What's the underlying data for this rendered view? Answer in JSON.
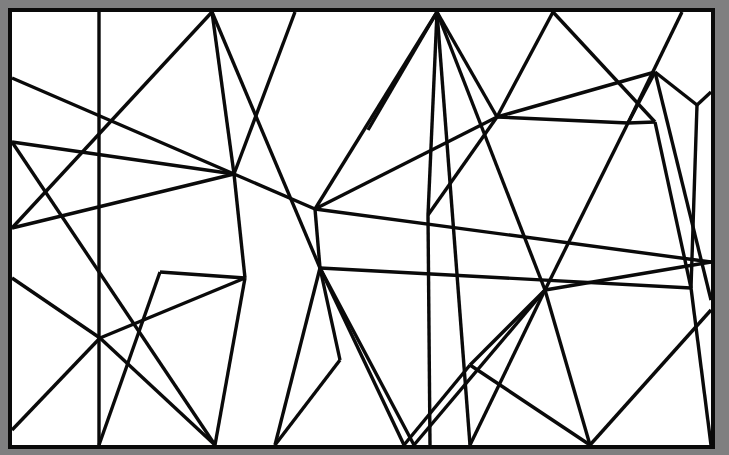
{
  "artwork": {
    "title": "Abstract Geometric Line Composition",
    "description": "Black straight-line segments forming irregular polygons inside a rectangular black frame on white ground, surrounded by a gray border.",
    "canvas": {
      "width": 729,
      "height": 455,
      "background_color": "#7f7f80",
      "paper_color": "#ffffff",
      "ink_color": "#0a0a0a",
      "frame_stroke_width": 4,
      "segment_stroke_width": 3.4
    },
    "frame": {
      "x": 10,
      "y": 10,
      "width": 703,
      "height": 437,
      "label": "outer-black-rectangle"
    },
    "segments": [
      {
        "id": "s01",
        "x1": 99,
        "y1": 12,
        "x2": 99,
        "y2": 445,
        "note": "long vertical near left"
      },
      {
        "id": "s02",
        "x1": 212,
        "y1": 12,
        "x2": 12,
        "y2": 228,
        "note": "top fan to left edge"
      },
      {
        "id": "s03",
        "x1": 212,
        "y1": 12,
        "x2": 234,
        "y2": 174,
        "note": "top fan to center hub"
      },
      {
        "id": "s04",
        "x1": 212,
        "y1": 12,
        "x2": 320,
        "y2": 268,
        "note": "top fan long diagonal"
      },
      {
        "id": "s05",
        "x1": 12,
        "y1": 78,
        "x2": 234,
        "y2": 174,
        "note": "left edge to center hub"
      },
      {
        "id": "s06",
        "x1": 234,
        "y1": 174,
        "x2": 12,
        "y2": 142,
        "note": "center hub to left V"
      },
      {
        "id": "s07",
        "x1": 12,
        "y1": 142,
        "x2": 215,
        "y2": 445,
        "note": "left V down to bottom"
      },
      {
        "id": "s08",
        "x1": 295,
        "y1": 12,
        "x2": 295,
        "y2": 12,
        "note": "top vertical start"
      },
      {
        "id": "s09",
        "x1": 295,
        "y1": 12,
        "x2": 234,
        "y2": 174,
        "note": "top vertical toward hub"
      },
      {
        "id": "s10",
        "x1": 234,
        "y1": 174,
        "x2": 245,
        "y2": 278,
        "note": "hub down segment"
      },
      {
        "id": "s11",
        "x1": 245,
        "y1": 278,
        "x2": 215,
        "y2": 445,
        "note": "down to bottom edge"
      },
      {
        "id": "s12",
        "x1": 437,
        "y1": 12,
        "x2": 368,
        "y2": 130,
        "note": "big fan leftmost"
      },
      {
        "id": "s13",
        "x1": 437,
        "y1": 12,
        "x2": 428,
        "y2": 215,
        "note": "big fan near vertical"
      },
      {
        "id": "s14",
        "x1": 437,
        "y1": 12,
        "x2": 315,
        "y2": 209,
        "note": "big fan to mid hub"
      },
      {
        "id": "s15",
        "x1": 437,
        "y1": 12,
        "x2": 470,
        "y2": 445,
        "note": "big fan long down"
      },
      {
        "id": "s16",
        "x1": 437,
        "y1": 12,
        "x2": 545,
        "y2": 290,
        "note": "big fan to right hub"
      },
      {
        "id": "s17",
        "x1": 437,
        "y1": 12,
        "x2": 497,
        "y2": 117,
        "note": "big fan short right"
      },
      {
        "id": "s18",
        "x1": 553,
        "y1": 12,
        "x2": 497,
        "y2": 117,
        "note": "top to junction"
      },
      {
        "id": "s19",
        "x1": 553,
        "y1": 12,
        "x2": 655,
        "y2": 122,
        "note": "top to right knot"
      },
      {
        "id": "s20",
        "x1": 682,
        "y1": 12,
        "x2": 628,
        "y2": 123,
        "note": "top right short"
      },
      {
        "id": "s21",
        "x1": 12,
        "y1": 228,
        "x2": 234,
        "y2": 174,
        "note": "left edge long to hub"
      },
      {
        "id": "s22",
        "x1": 234,
        "y1": 174,
        "x2": 315,
        "y2": 209,
        "note": "hub to mid hub"
      },
      {
        "id": "s23",
        "x1": 315,
        "y1": 209,
        "x2": 497,
        "y2": 117,
        "note": "mid hub to junction"
      },
      {
        "id": "s24",
        "x1": 497,
        "y1": 117,
        "x2": 655,
        "y2": 72,
        "note": "junction to upper right"
      },
      {
        "id": "s25",
        "x1": 655,
        "y1": 72,
        "x2": 697,
        "y2": 105,
        "note": "upper right to knot"
      },
      {
        "id": "s26",
        "x1": 697,
        "y1": 105,
        "x2": 711,
        "y2": 92,
        "note": "knot to right edge"
      },
      {
        "id": "s27",
        "x1": 697,
        "y1": 105,
        "x2": 691,
        "y2": 288,
        "note": "right long vertical"
      },
      {
        "id": "s28",
        "x1": 655,
        "y1": 72,
        "x2": 711,
        "y2": 300,
        "note": "upper right long down"
      },
      {
        "id": "s29",
        "x1": 315,
        "y1": 209,
        "x2": 711,
        "y2": 262,
        "note": "long near-horizontal right"
      },
      {
        "id": "s30",
        "x1": 315,
        "y1": 209,
        "x2": 320,
        "y2": 268,
        "note": "short link between hubs"
      },
      {
        "id": "s31",
        "x1": 320,
        "y1": 268,
        "x2": 691,
        "y2": 288,
        "note": "long horizontal spanning"
      },
      {
        "id": "s32",
        "x1": 320,
        "y1": 268,
        "x2": 275,
        "y2": 445,
        "note": "hub down to bottom"
      },
      {
        "id": "s33",
        "x1": 320,
        "y1": 268,
        "x2": 404,
        "y2": 445,
        "note": "hub down right to bottom"
      },
      {
        "id": "s34",
        "x1": 320,
        "y1": 268,
        "x2": 414,
        "y2": 445,
        "note": "hub down to bottom 2"
      },
      {
        "id": "s35",
        "x1": 245,
        "y1": 278,
        "x2": 100,
        "y2": 338,
        "note": "to left X crossing"
      },
      {
        "id": "s36",
        "x1": 100,
        "y1": 338,
        "x2": 12,
        "y2": 430,
        "note": "X to lower left corner"
      },
      {
        "id": "s37",
        "x1": 12,
        "y1": 278,
        "x2": 100,
        "y2": 338,
        "note": "left edge to X"
      },
      {
        "id": "s38",
        "x1": 100,
        "y1": 338,
        "x2": 215,
        "y2": 445,
        "note": "X down right to bottom"
      },
      {
        "id": "s39",
        "x1": 275,
        "y1": 445,
        "x2": 340,
        "y2": 360,
        "note": "lower mid up"
      },
      {
        "id": "s40",
        "x1": 340,
        "y1": 360,
        "x2": 320,
        "y2": 268,
        "note": "lower mid link"
      },
      {
        "id": "s41",
        "x1": 545,
        "y1": 290,
        "x2": 414,
        "y2": 445,
        "note": "right hub down left"
      },
      {
        "id": "s42",
        "x1": 545,
        "y1": 290,
        "x2": 470,
        "y2": 445,
        "note": "right hub down"
      },
      {
        "id": "s43",
        "x1": 545,
        "y1": 290,
        "x2": 590,
        "y2": 445,
        "note": "right hub down right"
      },
      {
        "id": "s44",
        "x1": 545,
        "y1": 290,
        "x2": 470,
        "y2": 365,
        "note": "right hub to lower knot"
      },
      {
        "id": "s45",
        "x1": 470,
        "y1": 365,
        "x2": 404,
        "y2": 445,
        "note": "lower knot down"
      },
      {
        "id": "s46",
        "x1": 470,
        "y1": 365,
        "x2": 590,
        "y2": 445,
        "note": "lower knot to bottom right"
      },
      {
        "id": "s47",
        "x1": 590,
        "y1": 445,
        "x2": 711,
        "y2": 310,
        "note": "bottom right diagonal up"
      },
      {
        "id": "s48",
        "x1": 691,
        "y1": 288,
        "x2": 711,
        "y2": 445,
        "note": "right edge lower"
      },
      {
        "id": "s49",
        "x1": 628,
        "y1": 123,
        "x2": 545,
        "y2": 290,
        "note": "mid right long down"
      },
      {
        "id": "s50",
        "x1": 628,
        "y1": 123,
        "x2": 497,
        "y2": 117,
        "note": "knot to junction"
      },
      {
        "id": "s51",
        "x1": 497,
        "y1": 117,
        "x2": 428,
        "y2": 215,
        "note": "junction down left"
      },
      {
        "id": "s52",
        "x1": 428,
        "y1": 215,
        "x2": 430,
        "y2": 445,
        "note": "near vertical to bottom"
      },
      {
        "id": "s53",
        "x1": 12,
        "y1": 430,
        "x2": 12,
        "y2": 430,
        "note": "corner anchor"
      },
      {
        "id": "s54",
        "x1": 99,
        "y1": 445,
        "x2": 160,
        "y2": 272,
        "note": "lower left up right"
      },
      {
        "id": "s55",
        "x1": 160,
        "y1": 272,
        "x2": 245,
        "y2": 278,
        "note": "left knot to mid"
      },
      {
        "id": "s56",
        "x1": 655,
        "y1": 122,
        "x2": 628,
        "y2": 123,
        "note": "right knot link"
      },
      {
        "id": "s57",
        "x1": 655,
        "y1": 72,
        "x2": 628,
        "y2": 123,
        "note": "knot triangle"
      },
      {
        "id": "s58",
        "x1": 545,
        "y1": 290,
        "x2": 711,
        "y2": 262,
        "note": "hub to right edge"
      },
      {
        "id": "s59",
        "x1": 691,
        "y1": 288,
        "x2": 655,
        "y2": 122,
        "note": "right vertical upper"
      }
    ],
    "vertices": [
      {
        "id": "v-top-a",
        "x": 212,
        "y": 12,
        "degree": 3
      },
      {
        "id": "v-top-b",
        "x": 295,
        "y": 12,
        "degree": 1
      },
      {
        "id": "v-top-hub",
        "x": 437,
        "y": 12,
        "degree": 6
      },
      {
        "id": "v-top-c",
        "x": 553,
        "y": 12,
        "degree": 2
      },
      {
        "id": "v-top-d",
        "x": 682,
        "y": 12,
        "degree": 1
      },
      {
        "id": "v-left-a",
        "x": 12,
        "y": 78,
        "degree": 1
      },
      {
        "id": "v-left-v",
        "x": 12,
        "y": 142,
        "degree": 2
      },
      {
        "id": "v-left-b",
        "x": 12,
        "y": 228,
        "degree": 1
      },
      {
        "id": "v-left-c",
        "x": 12,
        "y": 278,
        "degree": 1
      },
      {
        "id": "v-left-d",
        "x": 12,
        "y": 430,
        "degree": 1
      },
      {
        "id": "v-hub-1",
        "x": 234,
        "y": 174,
        "degree": 6
      },
      {
        "id": "v-hub-2",
        "x": 315,
        "y": 209,
        "degree": 5
      },
      {
        "id": "v-hub-3",
        "x": 320,
        "y": 268,
        "degree": 6
      },
      {
        "id": "v-hub-right",
        "x": 545,
        "y": 290,
        "degree": 6
      },
      {
        "id": "v-junction",
        "x": 497,
        "y": 117,
        "degree": 5
      },
      {
        "id": "v-knot-right",
        "x": 655,
        "y": 72,
        "degree": 3
      },
      {
        "id": "v-cross-left",
        "x": 100,
        "y": 338,
        "degree": 4
      }
    ],
    "stats": {
      "segment_count": 59,
      "vertex_count": 17,
      "palette": [
        "#0a0a0a",
        "#ffffff",
        "#7f7f80"
      ]
    }
  }
}
